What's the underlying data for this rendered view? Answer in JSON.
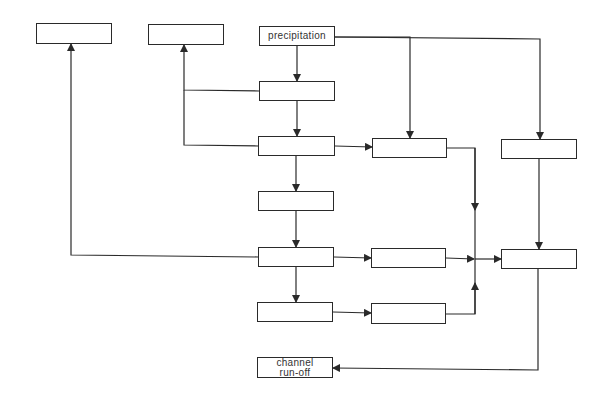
{
  "diagram": {
    "title": "",
    "style": {
      "line_color": "#2a2a2a",
      "box_border": "#2a2a2a",
      "background": "#ffffff",
      "text_color": "#333333"
    },
    "nodes": [
      {
        "id": "top-left-box",
        "label": "",
        "x": 36,
        "y": 23,
        "w": 76,
        "h": 21
      },
      {
        "id": "top-mid-box",
        "label": "",
        "x": 148,
        "y": 24,
        "w": 76,
        "h": 21
      },
      {
        "id": "precipitation",
        "label": "precipitation",
        "x": 259,
        "y": 26,
        "w": 76,
        "h": 20
      },
      {
        "id": "col1-row2",
        "label": "",
        "x": 259,
        "y": 81,
        "w": 76,
        "h": 20
      },
      {
        "id": "col1-row3",
        "label": "",
        "x": 258,
        "y": 136,
        "w": 77,
        "h": 20
      },
      {
        "id": "col2-row3",
        "label": "",
        "x": 372,
        "y": 138,
        "w": 75,
        "h": 20
      },
      {
        "id": "col3-row3",
        "label": "",
        "x": 501,
        "y": 139,
        "w": 76,
        "h": 20
      },
      {
        "id": "col1-row4",
        "label": "",
        "x": 258,
        "y": 191,
        "w": 76,
        "h": 20
      },
      {
        "id": "col1-row5",
        "label": "",
        "x": 258,
        "y": 247,
        "w": 76,
        "h": 20
      },
      {
        "id": "col2-row5",
        "label": "",
        "x": 371,
        "y": 248,
        "w": 75,
        "h": 20
      },
      {
        "id": "col3-row5",
        "label": "",
        "x": 501,
        "y": 249,
        "w": 76,
        "h": 20
      },
      {
        "id": "col1-row6",
        "label": "",
        "x": 257,
        "y": 302,
        "w": 76,
        "h": 20
      },
      {
        "id": "col2-row6",
        "label": "",
        "x": 371,
        "y": 303,
        "w": 75,
        "h": 21
      },
      {
        "id": "channel-runoff",
        "label": "channel\nrun-off",
        "x": 257,
        "y": 357,
        "w": 76,
        "h": 21
      }
    ],
    "edges": [
      {
        "from": "precipitation",
        "to": "col1-row2",
        "points": [
          [
            297,
            46
          ],
          [
            297,
            81
          ]
        ]
      },
      {
        "from": "precipitation",
        "to": "col2-row3",
        "points": [
          [
            335,
            37
          ],
          [
            410,
            37
          ],
          [
            410,
            138
          ]
        ]
      },
      {
        "from": "precipitation",
        "to": "col3-row3",
        "points": [
          [
            335,
            37
          ],
          [
            540,
            39
          ],
          [
            540,
            139
          ]
        ]
      },
      {
        "from": "col1-row2",
        "to": "col1-row3",
        "points": [
          [
            297,
            101
          ],
          [
            297,
            136
          ]
        ]
      },
      {
        "from": "col1-row2",
        "to": "top-mid-box",
        "points": [
          [
            259,
            91
          ],
          [
            184,
            90
          ],
          [
            184,
            45
          ]
        ]
      },
      {
        "from": "col1-row3",
        "to": "top-mid-box",
        "points": [
          [
            258,
            146
          ],
          [
            184,
            145
          ],
          [
            184,
            90
          ]
        ],
        "arrow": false
      },
      {
        "from": "col1-row3",
        "to": "col2-row3",
        "points": [
          [
            335,
            146
          ],
          [
            372,
            147
          ]
        ]
      },
      {
        "from": "col1-row3",
        "to": "col1-row4",
        "points": [
          [
            296,
            156
          ],
          [
            296,
            191
          ]
        ]
      },
      {
        "from": "col2-row3",
        "to": "col3-row5",
        "points": [
          [
            447,
            148
          ],
          [
            475,
            148
          ],
          [
            475,
            210
          ]
        ]
      },
      {
        "from": "col1-row4",
        "to": "col1-row5",
        "points": [
          [
            296,
            211
          ],
          [
            296,
            247
          ]
        ]
      },
      {
        "from": "col1-row5",
        "to": "top-left-box",
        "points": [
          [
            258,
            257
          ],
          [
            71,
            255
          ],
          [
            71,
            44
          ]
        ]
      },
      {
        "from": "col1-row5",
        "to": "col2-row5",
        "points": [
          [
            334,
            257
          ],
          [
            371,
            258
          ]
        ]
      },
      {
        "from": "col1-row5",
        "to": "col1-row6",
        "points": [
          [
            296,
            267
          ],
          [
            296,
            302
          ]
        ]
      },
      {
        "from": "col2-row5",
        "to": "col3-row5",
        "points": [
          [
            446,
            258
          ],
          [
            474,
            259
          ]
        ]
      },
      {
        "from": "junction",
        "to": "col3-row5",
        "points": [
          [
            475,
            259
          ],
          [
            501,
            259
          ]
        ]
      },
      {
        "from": "col2-row6",
        "to": "col3-row5",
        "points": [
          [
            446,
            314
          ],
          [
            475,
            314
          ],
          [
            475,
            283
          ]
        ]
      },
      {
        "from": "col1-row6",
        "to": "col2-row6",
        "points": [
          [
            333,
            312
          ],
          [
            371,
            313
          ]
        ]
      },
      {
        "from": "col3-row3",
        "to": "col3-row5",
        "points": [
          [
            539,
            159
          ],
          [
            539,
            249
          ]
        ]
      },
      {
        "from": "col3-row5",
        "to": "channel-runoff",
        "points": [
          [
            538,
            269
          ],
          [
            538,
            370
          ],
          [
            333,
            368
          ]
        ]
      }
    ],
    "vertical_trunk": {
      "x": 475,
      "y1": 148,
      "y2": 314
    }
  }
}
